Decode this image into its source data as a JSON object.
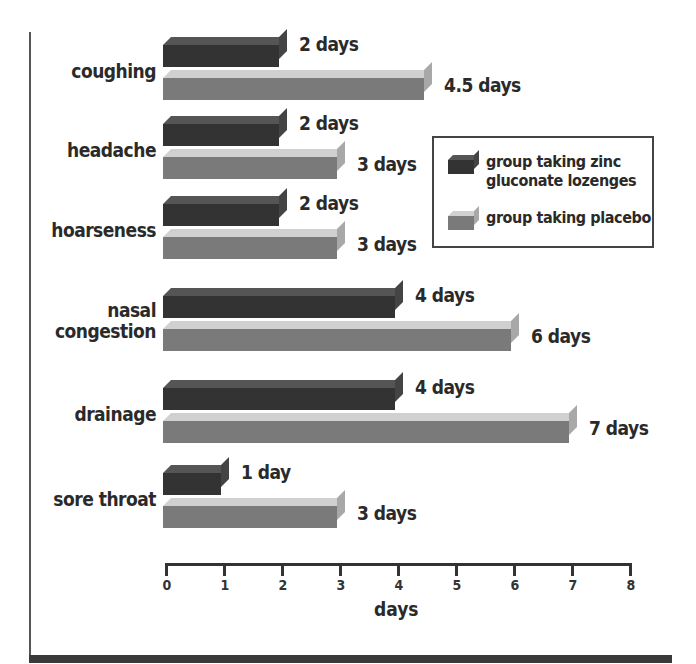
{
  "chart_data": {
    "type": "bar",
    "orientation": "horizontal",
    "style": "3d",
    "title": "",
    "xlabel": "days",
    "ylabel": "",
    "xlim": [
      0,
      8
    ],
    "x_ticks": [
      "0",
      "1",
      "2",
      "3",
      "4",
      "5",
      "6",
      "7",
      "8"
    ],
    "grid": false,
    "legend_position": "right-upper",
    "categories": [
      "coughing",
      "headache",
      "hoarseness",
      "nasal congestion",
      "drainage",
      "sore throat"
    ],
    "series": [
      {
        "name": "group taking zinc gluconate lozenges",
        "color": "#333333",
        "values": [
          2,
          2,
          2,
          4,
          4,
          1
        ],
        "labels": [
          "2 days",
          "2 days",
          "2 days",
          "4 days",
          "4 days",
          "1 day"
        ]
      },
      {
        "name": "group taking placebo",
        "color": "#7a7a7a",
        "values": [
          4.5,
          3,
          3,
          6,
          7,
          3
        ],
        "labels": [
          "4.5 days",
          "3 days",
          "3 days",
          "6 days",
          "7 days",
          "3 days"
        ]
      }
    ]
  },
  "categories": [
    {
      "label_lines": [
        "coughing"
      ],
      "zinc_label": "2 days",
      "placebo_label": "4.5 days"
    },
    {
      "label_lines": [
        "headache"
      ],
      "zinc_label": "2 days",
      "placebo_label": "3 days"
    },
    {
      "label_lines": [
        "hoarseness"
      ],
      "zinc_label": "2 days",
      "placebo_label": "3 days"
    },
    {
      "label_lines": [
        "nasal",
        "congestion"
      ],
      "zinc_label": "4 days",
      "placebo_label": "6 days"
    },
    {
      "label_lines": [
        "drainage"
      ],
      "zinc_label": "4 days",
      "placebo_label": "7 days"
    },
    {
      "label_lines": [
        "sore throat"
      ],
      "zinc_label": "1 day",
      "placebo_label": "3 days"
    }
  ],
  "legend": {
    "zinc_line1": "group taking zinc",
    "zinc_line2": "gluconate lozenges",
    "placebo": "group taking placebo"
  },
  "axis": {
    "ticks": [
      "0",
      "1",
      "2",
      "3",
      "4",
      "5",
      "6",
      "7",
      "8"
    ],
    "title": "days"
  }
}
